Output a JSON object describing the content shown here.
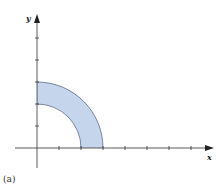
{
  "figure": {
    "caption": "(a)",
    "x_axis_label": "x",
    "y_axis_label": "y",
    "colors": {
      "region_fill": "#c5d5eb",
      "region_stroke": "#5a6d8a",
      "axis": "#333333"
    },
    "region": {
      "shape": "quarter-annulus (first quadrant)",
      "inner_radius_units": 2,
      "outer_radius_units": 3
    },
    "x_ticks_count": 5,
    "y_ticks_count": 5
  }
}
